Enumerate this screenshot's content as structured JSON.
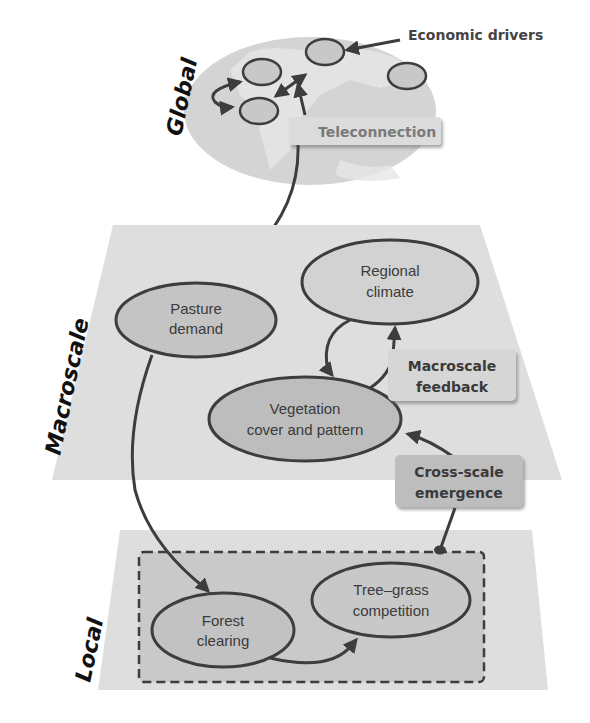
{
  "scales": {
    "global": "Global",
    "macroscale": "Macroscale",
    "local": "Local"
  },
  "global_layer": {
    "callout_economic": "Economic drivers",
    "callout_teleconnection": "Teleconnection",
    "driver_nodes": 4
  },
  "macroscale_layer": {
    "nodes": {
      "pasture_demand": [
        "Pasture",
        "demand"
      ],
      "regional_climate": [
        "Regional",
        "climate"
      ],
      "vegetation": [
        "Vegetation",
        "cover and pattern"
      ]
    },
    "boxes": {
      "macroscale_feedback": [
        "Macroscale",
        "feedback"
      ],
      "cross_scale_emergence": [
        "Cross-scale",
        "emergence"
      ]
    }
  },
  "local_layer": {
    "nodes": {
      "forest_clearing": [
        "Forest",
        "clearing"
      ],
      "tree_grass": [
        "Tree–grass",
        "competition"
      ]
    }
  },
  "colors": {
    "plane": "#dedede",
    "node_fill": "#cfcfcf",
    "node_dark_fill": "#bdbdbd",
    "stroke": "#3d3d3d",
    "box_fill": "#d6d6d6",
    "box_dark_fill": "#bcbcbc",
    "local_inner": "#c9c9c9"
  }
}
